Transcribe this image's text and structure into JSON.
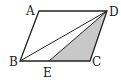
{
  "diagram": {
    "type": "geometry",
    "colors": {
      "stroke": "#222222",
      "shade": "#c8c8c8",
      "background": "#ffffff"
    },
    "points": {
      "A": {
        "label": "A",
        "x": 39,
        "y": 11
      },
      "D": {
        "label": "D",
        "x": 107,
        "y": 11
      },
      "B": {
        "label": "B",
        "x": 20,
        "y": 61
      },
      "C": {
        "label": "C",
        "x": 90,
        "y": 61
      },
      "E": {
        "label": "E",
        "x": 49,
        "y": 61
      }
    },
    "segments": [
      "AD",
      "DC",
      "CB",
      "BA",
      "BD",
      "DE"
    ],
    "shaded_region": [
      "D",
      "E",
      "C"
    ]
  }
}
